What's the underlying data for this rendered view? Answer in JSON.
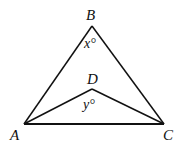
{
  "diagram": {
    "points": {
      "A": {
        "label": "A",
        "x": 24,
        "y": 124
      },
      "B": {
        "label": "B",
        "x": 92,
        "y": 26
      },
      "C": {
        "label": "C",
        "x": 164,
        "y": 124
      },
      "D": {
        "label": "D",
        "x": 92,
        "y": 89
      }
    },
    "segments": [
      "AB",
      "BC",
      "AC",
      "AD",
      "DC"
    ],
    "angles": {
      "at_B": {
        "label": "x°"
      },
      "at_D": {
        "label": "y°"
      }
    },
    "colors": {
      "stroke": "#111111",
      "background": "#ffffff"
    }
  }
}
